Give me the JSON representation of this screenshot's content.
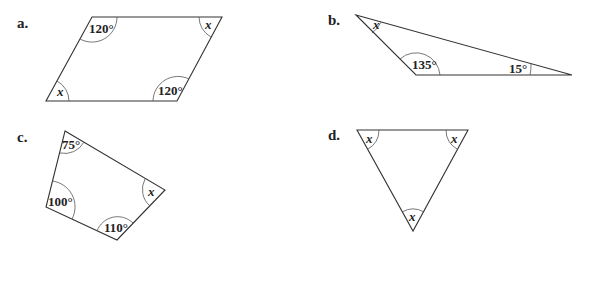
{
  "figures": [
    {
      "label": "a.",
      "shape": "parallelogram",
      "vertices": [
        [
          92,
          17
        ],
        [
          222,
          17
        ],
        [
          177,
          101
        ],
        [
          46,
          101
        ]
      ],
      "angles": [
        {
          "text": "120°",
          "vertex": 0
        },
        {
          "text": "x",
          "vertex": 1
        },
        {
          "text": "120°",
          "vertex": 2
        },
        {
          "text": "x",
          "vertex": 3
        }
      ]
    },
    {
      "label": "b.",
      "shape": "triangle",
      "vertices": [
        [
          356,
          15
        ],
        [
          572,
          75
        ],
        [
          416,
          75
        ]
      ],
      "angles": [
        {
          "text": "x",
          "vertex": 0
        },
        {
          "text": "15°",
          "vertex": 1
        },
        {
          "text": "135°",
          "vertex": 2
        }
      ]
    },
    {
      "label": "c.",
      "shape": "quadrilateral",
      "vertices": [
        [
          65,
          131
        ],
        [
          165,
          190
        ],
        [
          117,
          240
        ],
        [
          46,
          207
        ]
      ],
      "angles": [
        {
          "text": "75°",
          "vertex": 0
        },
        {
          "text": "x",
          "vertex": 1
        },
        {
          "text": "110°",
          "vertex": 2
        },
        {
          "text": "100°",
          "vertex": 3
        }
      ]
    },
    {
      "label": "d.",
      "shape": "equilateral-triangle",
      "vertices": [
        [
          357,
          130
        ],
        [
          468,
          130
        ],
        [
          413,
          231
        ]
      ],
      "angles": [
        {
          "text": "x",
          "vertex": 0
        },
        {
          "text": "x",
          "vertex": 1
        },
        {
          "text": "x",
          "vertex": 2
        }
      ]
    }
  ],
  "labels": {
    "a": "a.",
    "b": "b.",
    "c": "c.",
    "d": "d."
  }
}
